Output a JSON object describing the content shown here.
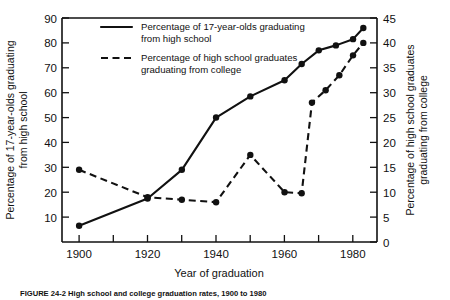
{
  "figure": {
    "caption": "FIGURE 24-2 High school and college graduation rates, 1900 to 1980"
  },
  "legend": [
    {
      "style": "solid",
      "line1": "Percentage of 17-year-olds graduating",
      "line2": "from high school"
    },
    {
      "style": "dashed",
      "line1": "Percentage of high school graduates",
      "line2": "graduating from college"
    }
  ],
  "chart_data": {
    "type": "line",
    "title": "",
    "xlabel": "Year of graduation",
    "ylabel": "Percentage of 17-year-olds graduating from high school",
    "y2label": "Percentage of high school graduates graduating from college",
    "xlim": [
      1895,
      1987
    ],
    "ylim": [
      0,
      90
    ],
    "y2lim": [
      0,
      45
    ],
    "xticks": [
      1900,
      1910,
      1920,
      1930,
      1940,
      1950,
      1960,
      1970,
      1980
    ],
    "xticklabels": [
      "1900",
      "",
      "1920",
      "",
      "1940",
      "",
      "1960",
      "",
      "1980"
    ],
    "yticks": [
      10,
      20,
      30,
      40,
      50,
      60,
      70,
      80,
      90
    ],
    "yticklabels": [
      "10",
      "20",
      "30",
      "40",
      "50",
      "60",
      "70",
      "80",
      "90"
    ],
    "y2ticks": [
      0,
      5,
      10,
      15,
      20,
      25,
      30,
      35,
      40,
      45
    ],
    "y2ticklabels": [
      "0",
      "5",
      "10",
      "15",
      "20",
      "25",
      "30",
      "35",
      "40",
      "45"
    ],
    "grid": false,
    "legend_position": "top-center",
    "series": [
      {
        "name": "Percentage of 17-year-olds graduating from high school",
        "style": "solid",
        "axis": "left",
        "x": [
          1900,
          1920,
          1930,
          1940,
          1950,
          1960,
          1965,
          1970,
          1975,
          1980,
          1983
        ],
        "values": [
          6.5,
          17.5,
          29,
          50,
          58.5,
          65,
          71.5,
          77,
          79,
          81.5,
          86
        ]
      },
      {
        "name": "Percentage of high school graduates graduating from college",
        "style": "dashed",
        "axis": "right",
        "x": [
          1900,
          1920,
          1930,
          1940,
          1950,
          1960,
          1965,
          1968,
          1972,
          1976,
          1980,
          1983
        ],
        "values": [
          14.5,
          9,
          8.5,
          8,
          17.5,
          10,
          9.8,
          28,
          30.5,
          33.5,
          37.5,
          40
        ]
      }
    ]
  }
}
